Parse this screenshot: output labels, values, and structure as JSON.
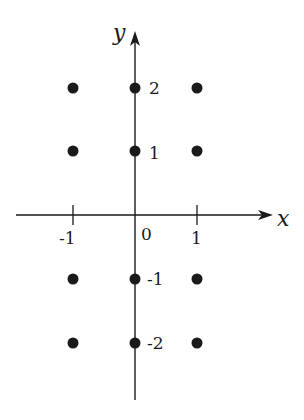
{
  "diagram": {
    "type": "lattice-points",
    "axes": {
      "x_label": "x",
      "y_label": "y",
      "origin_label": "0"
    },
    "x_ticks": [
      {
        "value": -1,
        "label": "-1"
      },
      {
        "value": 1,
        "label": "1"
      }
    ],
    "y_ticks": [
      {
        "value": 2,
        "label": "2"
      },
      {
        "value": 1,
        "label": "1"
      },
      {
        "value": -1,
        "label": "-1"
      },
      {
        "value": -2,
        "label": "-2"
      }
    ],
    "points": [
      {
        "x": -1,
        "y": 2
      },
      {
        "x": 0,
        "y": 2
      },
      {
        "x": 1,
        "y": 2
      },
      {
        "x": -1,
        "y": 1
      },
      {
        "x": 0,
        "y": 1
      },
      {
        "x": 1,
        "y": 1
      },
      {
        "x": -1,
        "y": -1
      },
      {
        "x": 0,
        "y": -1
      },
      {
        "x": 1,
        "y": -1
      },
      {
        "x": -1,
        "y": -2
      },
      {
        "x": 0,
        "y": -2
      },
      {
        "x": 1,
        "y": -2
      }
    ],
    "colors": {
      "ink": "#1a1a1a",
      "background": "#ffffff"
    }
  }
}
